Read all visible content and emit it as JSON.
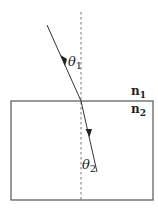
{
  "diagram": {
    "type": "refraction",
    "colors": {
      "line": "#444444",
      "normal": "#777777",
      "background": "#ffffff"
    },
    "labels": {
      "theta1": {
        "symbol": "θ",
        "sub": "1"
      },
      "theta2": {
        "symbol": "θ",
        "sub": "2"
      },
      "n1": {
        "symbol": "n",
        "sub": "1"
      },
      "n2": {
        "symbol": "n",
        "sub": "2"
      }
    }
  }
}
